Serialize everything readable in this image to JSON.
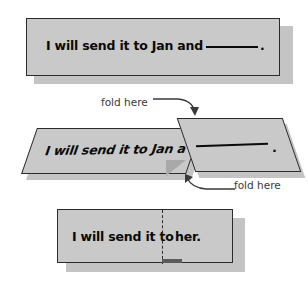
{
  "figure": {
    "card_fill_color": "#c9c9c9",
    "card_border_color": "#2b2b2b",
    "shadow_color": "#c4c4c4",
    "text_color": "#0a0a0a",
    "annotation_color": "#3a3a3a"
  },
  "top_strip": {
    "text_before_blank": "I will send it to Jan and",
    "blank": "________",
    "text_after_blank": "."
  },
  "middle_strip": {
    "left_panel_text": "I will send it to Jan a",
    "right_flap_blank": "________",
    "right_flap_period": ".",
    "fold_label_top": "fold here",
    "fold_label_bottom": "fold here"
  },
  "bottom_strip": {
    "left_text": "I will send it to",
    "right_text": "her."
  }
}
